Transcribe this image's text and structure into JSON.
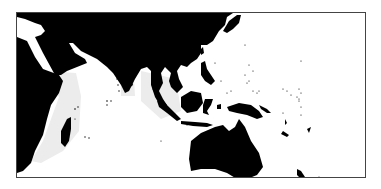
{
  "map": {
    "title": "",
    "region": "Indian Ocean and Western Pacific",
    "colors": {
      "land": "#000000",
      "ocean": "#ffffff",
      "shallow_water": "#ececec",
      "frame": "#444444"
    },
    "land_masses": [
      "Africa",
      "Arabian Peninsula",
      "Asia",
      "India",
      "Sri Lanka",
      "Indochina",
      "Sumatra",
      "Java",
      "Borneo",
      "Sulawesi",
      "Philippines",
      "Japan",
      "New Guinea",
      "Australia",
      "Madagascar",
      "New Zealand",
      "Pacific Islands"
    ],
    "water_bodies": [
      "Mediterranean Sea",
      "Red Sea",
      "Persian Gulf",
      "Indian Ocean",
      "Pacific Ocean"
    ]
  }
}
